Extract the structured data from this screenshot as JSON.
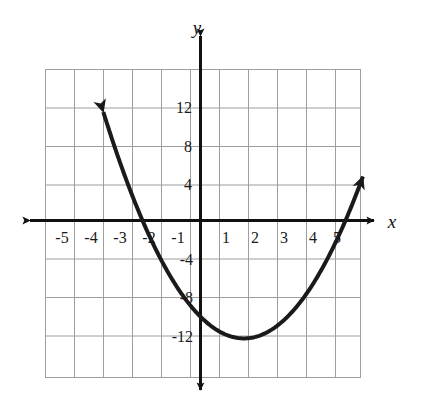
{
  "chart_data": {
    "type": "line",
    "title": "",
    "subtitle": "",
    "xlabel": "x",
    "ylabel": "y",
    "xlim": [
      -5.5,
      5.5
    ],
    "ylim": [
      -16,
      16
    ],
    "grid": true,
    "legend_position": "none",
    "x_ticks": [
      -5,
      -4,
      -3,
      -2,
      -1,
      1,
      2,
      3,
      4,
      5
    ],
    "x_tick_labels": [
      "-5",
      "-4",
      "-3",
      "-2",
      "-1",
      "1",
      "2",
      "3",
      "4",
      "5"
    ],
    "y_ticks": [
      12,
      8,
      4,
      -4,
      -8,
      -12
    ],
    "y_tick_labels": [
      "12",
      "8",
      "4",
      "-4",
      "-8",
      "-12"
    ],
    "x_minor_step": 1,
    "y_minor_step": 4,
    "series": [
      {
        "name": "parabola",
        "equation": "y = x^2 - 3x - 10",
        "color": "#1a1a1a",
        "roots": [
          -2,
          5
        ],
        "vertex": [
          1.5,
          -12.25
        ],
        "arrow_start": [
          -3.35,
          14.5
        ],
        "arrow_end": [
          5.6,
          8.3
        ],
        "x": [
          -3.35,
          -3.0,
          -2.5,
          -2.0,
          -1.5,
          -1.0,
          -0.5,
          0.0,
          0.5,
          1.0,
          1.5,
          2.0,
          2.5,
          3.0,
          3.5,
          4.0,
          4.5,
          5.0,
          5.5,
          5.6
        ],
        "y": [
          11.27,
          8.0,
          3.75,
          0.0,
          -3.25,
          -6.0,
          -8.25,
          -10.0,
          -11.25,
          -12.0,
          -12.25,
          -12.0,
          -11.25,
          -10.0,
          -8.25,
          -6.0,
          -3.25,
          0.0,
          3.75,
          4.68
        ]
      }
    ],
    "annotations": []
  },
  "axes": {
    "x_letter": "x",
    "y_letter": "y"
  },
  "icons": {
    "x_axis_arrow_right": "arrow-right-icon",
    "x_axis_arrow_left": "arrow-left-icon",
    "y_axis_arrow_up": "arrow-up-icon",
    "y_axis_arrow_down": "arrow-down-icon",
    "curve_arrow_left": "curve-arrow-up-left-icon",
    "curve_arrow_right": "curve-arrow-up-right-icon"
  }
}
